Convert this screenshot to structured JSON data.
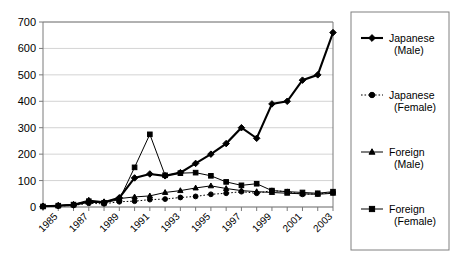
{
  "chart_data": {
    "type": "line",
    "title": "",
    "xlabel": "",
    "ylabel": "",
    "ylim": [
      0,
      700
    ],
    "ytick_step": 100,
    "yticks": [
      0,
      100,
      200,
      300,
      400,
      500,
      600,
      700
    ],
    "grid": true,
    "legend_position": "right-outside",
    "x": [
      1984,
      1985,
      1986,
      1987,
      1988,
      1989,
      1990,
      1991,
      1992,
      1993,
      1994,
      1995,
      1996,
      1997,
      1998,
      1999,
      2000,
      2001,
      2002,
      2003
    ],
    "xtick_labels": [
      "1985",
      "1987",
      "1989",
      "1991",
      "1993",
      "1995",
      "1997",
      "1999",
      "2001",
      "2003"
    ],
    "xtick_values": [
      1985,
      1987,
      1989,
      1991,
      1993,
      1995,
      1997,
      1999,
      2001,
      2003
    ],
    "series": [
      {
        "name": "Japanese (Male)",
        "marker": "diamond",
        "line_style": "solid-thick",
        "values": [
          3,
          5,
          8,
          20,
          18,
          35,
          110,
          125,
          118,
          130,
          165,
          200,
          240,
          300,
          260,
          390,
          400,
          480,
          500,
          660
        ]
      },
      {
        "name": "Japanese (Female)",
        "marker": "circle",
        "line_style": "dotted",
        "values": [
          2,
          4,
          6,
          14,
          12,
          20,
          22,
          28,
          30,
          36,
          40,
          48,
          52,
          58,
          52,
          62,
          58,
          48,
          50,
          55
        ]
      },
      {
        "name": "Foreign (Male)",
        "marker": "triangle",
        "line_style": "solid-thin",
        "values": [
          3,
          6,
          10,
          26,
          20,
          32,
          38,
          42,
          55,
          62,
          72,
          80,
          70,
          62,
          58,
          55,
          52,
          50,
          48,
          52
        ]
      },
      {
        "name": "Foreign (Female)",
        "marker": "square",
        "line_style": "solid-thin",
        "values": [
          2,
          5,
          9,
          22,
          16,
          28,
          150,
          275,
          120,
          128,
          130,
          118,
          95,
          82,
          88,
          62,
          58,
          55,
          52,
          58
        ]
      }
    ]
  },
  "legend": {
    "entries": [
      {
        "label_line1": "Japanese",
        "label_line2": "(Male)"
      },
      {
        "label_line1": "Japanese",
        "label_line2": "(Female)"
      },
      {
        "label_line1": "Foreign",
        "label_line2": "(Male)"
      },
      {
        "label_line1": "Foreign",
        "label_line2": "(Female)"
      }
    ]
  }
}
